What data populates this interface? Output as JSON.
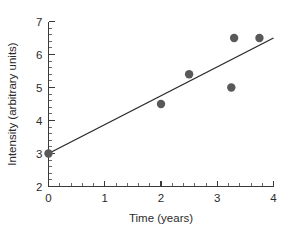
{
  "chart_data": {
    "type": "scatter",
    "title": "",
    "subtitle": "",
    "xlabel": "Time (years)",
    "ylabel": "Intensity (arbitrary units)",
    "xlim": [
      0,
      4
    ],
    "ylim": [
      2,
      7
    ],
    "xticks": [
      0,
      1,
      2,
      3,
      4
    ],
    "xticklabels": [
      "0",
      "1",
      "2",
      "3",
      "4"
    ],
    "yticks": [
      2,
      3,
      4,
      5,
      6,
      7
    ],
    "yticklabels": [
      "2",
      "3",
      "4",
      "5",
      "6",
      "7"
    ],
    "x_minor_tick_step": 0.2,
    "y_minor_tick_step": 0.2,
    "grid": false,
    "legend": null,
    "annotations": [],
    "marker_color": "#595959",
    "line_color": "#2b2b2b",
    "axis_color": "#3a3a3a",
    "background_color": "#ffffff",
    "series": [
      {
        "name": "observations",
        "type": "scatter",
        "x": [
          0,
          2,
          2.5,
          3.25,
          3.3,
          3.75
        ],
        "y": [
          3.0,
          4.5,
          5.4,
          5.0,
          6.5,
          6.5
        ]
      },
      {
        "name": "linear fit",
        "type": "line",
        "x": [
          0,
          4
        ],
        "y": [
          3.0,
          6.5
        ]
      }
    ]
  }
}
